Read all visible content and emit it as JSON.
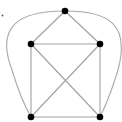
{
  "diagram": {
    "type": "graph",
    "edge_color": "#a0a0a0",
    "curve_color": "#a8a8a8",
    "vertex_color": "#000000",
    "vertex_radius": 3.3,
    "stray_dot": {
      "x": 2.5,
      "y": 15.5,
      "r": 0.9
    },
    "vertices": [
      {
        "id": "top",
        "x": 65,
        "y": 11
      },
      {
        "id": "mid-left",
        "x": 31,
        "y": 44
      },
      {
        "id": "mid-right",
        "x": 100,
        "y": 44
      },
      {
        "id": "bottom-left",
        "x": 31,
        "y": 117
      },
      {
        "id": "bottom-right",
        "x": 100,
        "y": 117
      }
    ],
    "edges": [
      [
        "top",
        "mid-left"
      ],
      [
        "top",
        "mid-right"
      ],
      [
        "mid-left",
        "mid-right"
      ],
      [
        "mid-left",
        "bottom-left"
      ],
      [
        "mid-right",
        "bottom-right"
      ],
      [
        "bottom-left",
        "bottom-right"
      ],
      [
        "mid-left",
        "bottom-right"
      ],
      [
        "mid-right",
        "bottom-left"
      ]
    ],
    "curved_edges": [
      {
        "from": "top",
        "to": "bottom-left",
        "path": "M65,11 C20,11 -5,25 12,70 C18,90 24,105 31,117"
      },
      {
        "from": "top",
        "to": "bottom-right",
        "path": "M65,11 C110,11 130,25 118,70 C112,90 106,105 100,117"
      }
    ]
  }
}
